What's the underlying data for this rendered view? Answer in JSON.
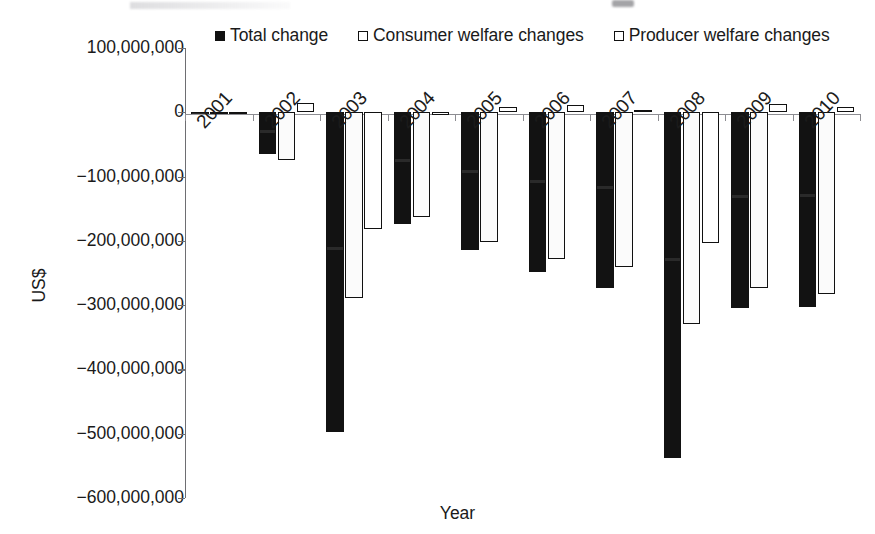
{
  "axes": {
    "ylabel": "US$",
    "xlabel": "Year",
    "yticks": [
      "100,000,000",
      "0",
      "−100,000,000",
      "−200,000,000",
      "−300,000,000",
      "−400,000,000",
      "−500,000,000",
      "−600,000,000"
    ]
  },
  "legend": {
    "items": [
      {
        "label": "Total change",
        "swatch": "filled-square-marker",
        "color": "#121212"
      },
      {
        "label": "Consumer welfare changes",
        "swatch": "hollow-square-marker",
        "color": "#ffffff"
      },
      {
        "label": "Producer welfare changes",
        "swatch": "hollow-square-marker",
        "color": "#ffffff"
      }
    ]
  },
  "chart_data": {
    "type": "bar",
    "title": "",
    "xlabel": "Year",
    "ylabel": "US$",
    "ylim": [
      -600000000,
      100000000
    ],
    "ytick_step": 100000000,
    "grid": false,
    "legend_position": "top",
    "categories": [
      "2001",
      "2002",
      "2003",
      "2004",
      "2005",
      "2006",
      "2007",
      "2008",
      "2009",
      "2010"
    ],
    "series": [
      {
        "name": "Total change",
        "color": "#121212",
        "values": [
          -3000000,
          -65000000,
          -497000000,
          -174000000,
          -215000000,
          -249000000,
          -274000000,
          -538000000,
          -305000000,
          -303000000
        ]
      },
      {
        "name": "Consumer welfare changes",
        "color": "#ffffff",
        "values": [
          -2000000,
          -75000000,
          -289000000,
          -163000000,
          -202000000,
          -229000000,
          -240000000,
          -329000000,
          -274000000,
          -283000000
        ]
      },
      {
        "name": "Producer welfare changes",
        "color": "#ffffff",
        "values": [
          1000000,
          14000000,
          -181000000,
          -5000000,
          9000000,
          11000000,
          4000000,
          -203000000,
          13000000,
          8000000
        ]
      }
    ]
  }
}
